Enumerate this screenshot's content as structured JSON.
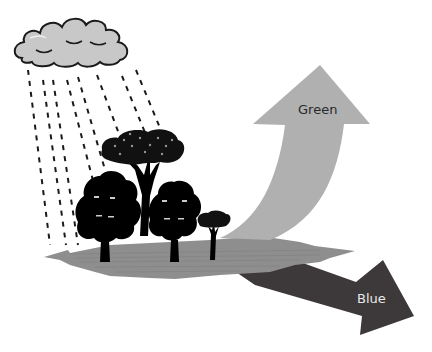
{
  "diagram": {
    "title": "",
    "elements": {
      "cloud": {
        "icon": "rain-cloud-icon",
        "fill": "#c8c8c8",
        "stroke": "#1a1a1a"
      },
      "rain": {
        "icon": "rain-streaks",
        "stroke": "#1a1a1a"
      },
      "ground": {
        "fill": "#8e8e8e"
      },
      "trees": [
        "broadleaf-tree",
        "tall-canopy-tree",
        "broadleaf-tree",
        "small-tree"
      ],
      "green_arrow": {
        "label": "Green",
        "fill": "#b0b0b0",
        "direction": "up"
      },
      "blue_arrow": {
        "label": "Blue",
        "fill": "#3d3839",
        "direction": "down-right"
      }
    }
  },
  "colors": {
    "background": "#ffffff",
    "cloud": "#c8c8c8",
    "ground": "#8e8e8e",
    "green_arrow": "#b0b0b0",
    "blue_arrow": "#3d3839",
    "trees": "#000000"
  }
}
